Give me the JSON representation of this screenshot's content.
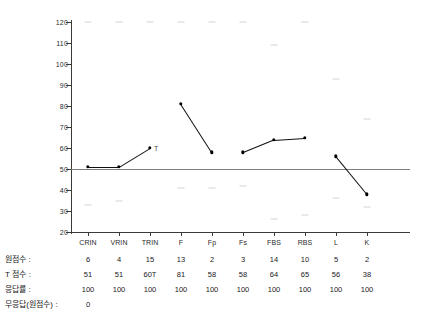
{
  "chart_data": {
    "type": "line",
    "title": "",
    "xlabel": "",
    "ylabel": "",
    "ylim": [
      20,
      120
    ],
    "yticks": [
      20,
      30,
      40,
      50,
      60,
      70,
      80,
      90,
      100,
      110,
      120
    ],
    "grid": false,
    "legend": "none",
    "reference_line": 50,
    "categories": [
      "CRIN",
      "VRIN",
      "TRIN",
      "F",
      "Fp",
      "Fs",
      "FBS",
      "RBS",
      "L",
      "K"
    ],
    "series": [
      {
        "name": "T 점수",
        "values": [
          51,
          51,
          60,
          81,
          58,
          58,
          64,
          65,
          56,
          38
        ],
        "connected_groups": [
          [
            0,
            1,
            2
          ],
          [
            3,
            4
          ],
          [
            5,
            6,
            7
          ],
          [
            8,
            9
          ]
        ]
      }
    ],
    "point_annotations": [
      {
        "category": "TRIN",
        "label": "T"
      }
    ],
    "reference_marks": [
      {
        "category": "CRIN",
        "values": [
          120,
          33
        ]
      },
      {
        "category": "VRIN",
        "values": [
          120,
          35
        ]
      },
      {
        "category": "TRIN",
        "values": [
          120
        ]
      },
      {
        "category": "F",
        "values": [
          120,
          41
        ]
      },
      {
        "category": "Fp",
        "values": [
          120,
          41
        ]
      },
      {
        "category": "Fs",
        "values": [
          120,
          42
        ]
      },
      {
        "category": "FBS",
        "values": [
          109,
          26
        ]
      },
      {
        "category": "RBS",
        "values": [
          120,
          28
        ]
      },
      {
        "category": "L",
        "values": [
          93,
          36
        ]
      },
      {
        "category": "K",
        "values": [
          74,
          32
        ]
      }
    ]
  },
  "table": {
    "rows": [
      {
        "label": "원점수 :",
        "values": [
          "6",
          "4",
          "15",
          "13",
          "2",
          "3",
          "14",
          "10",
          "5",
          "2"
        ]
      },
      {
        "label": "T 점수 :",
        "values": [
          "51",
          "51",
          "60T",
          "81",
          "58",
          "58",
          "64",
          "65",
          "56",
          "38"
        ]
      },
      {
        "label": "응답률 :",
        "values": [
          "100",
          "100",
          "100",
          "100",
          "100",
          "100",
          "100",
          "100",
          "100",
          "100"
        ]
      },
      {
        "label": "무응답(원점수) :",
        "values": [
          "0"
        ]
      }
    ]
  }
}
